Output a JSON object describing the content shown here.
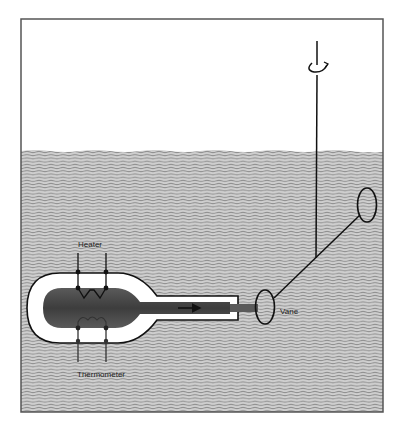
{
  "diagram": {
    "type": "apparatus-schematic",
    "labels": {
      "heater": "Heater",
      "thermometer": "Thermometer",
      "vane": "Vane"
    },
    "components": [
      {
        "id": "tank",
        "description": "Rectangular tank partially filled with liquid"
      },
      {
        "id": "liquid",
        "description": "Liquid filling lower portion of tank (hatched wavy lines)"
      },
      {
        "id": "heated-vessel",
        "description": "Rounded capsule vessel with insulating white jacket and dark heated core"
      },
      {
        "id": "heater",
        "description": "Heater coil with two leads entering from top"
      },
      {
        "id": "thermometer",
        "description": "Thermometer coil with two leads exiting from bottom"
      },
      {
        "id": "nozzle",
        "description": "Outlet tube emitting a jet toward the vane"
      },
      {
        "id": "jet-arrow",
        "description": "Arrow indicating flow direction through nozzle"
      },
      {
        "id": "vane",
        "description": "Oval vane struck by jet"
      },
      {
        "id": "counter-vane",
        "description": "Second oval vane on opposite arm end"
      },
      {
        "id": "rotor-arm",
        "description": "Diagonal arm connecting both vanes"
      },
      {
        "id": "shaft",
        "description": "Vertical suspension shaft"
      },
      {
        "id": "rotation-indicator",
        "description": "Circular arrow indicating rotation about shaft"
      }
    ],
    "colors": {
      "frame": "#555555",
      "liquid": "#c9c9c9",
      "liquid_lines": "#8f8f8f",
      "core": "#4a4a4a",
      "ink": "#111111",
      "jacket": "#ffffff"
    }
  }
}
